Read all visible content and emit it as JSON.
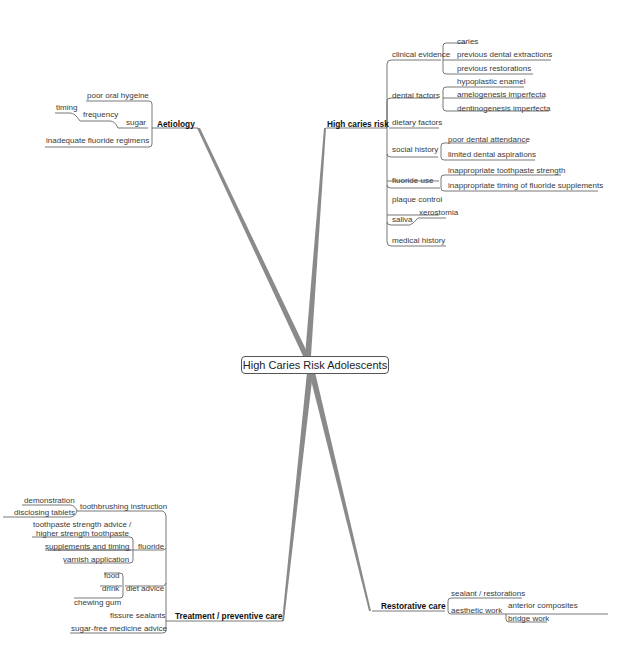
{
  "central": {
    "label": "High Caries Risk Adolescents"
  },
  "branches": {
    "aetiology": {
      "label": "Aetiology",
      "items": {
        "poor_oral_hygiene": "poor oral hygeine",
        "sugar": "sugar",
        "frequency": "frequency",
        "timing": "timing",
        "fluoride_regimens": "inadequate fluoride regimens"
      }
    },
    "high_caries_risk": {
      "label": "High caries risk",
      "clinical_evidence": {
        "label": "clinical evidence",
        "items": [
          "caries",
          "previous dental extractions",
          "previous restorations"
        ]
      },
      "dental_factors": {
        "label": "dental factors",
        "items": [
          "hypoplastic enamel",
          "amelogenesis imperfecta",
          "dentinogenesis imperfecta"
        ]
      },
      "dietary_factors": {
        "label": "dietary factors"
      },
      "social_history": {
        "label": "social history",
        "items": [
          "poor dental attendance",
          "limited dental aspirations"
        ]
      },
      "fluoride_use": {
        "label": "fluoride use",
        "items": [
          "inappropriate toothpaste strength",
          "inappropriate timing of fluoride supplements"
        ]
      },
      "plaque_control": {
        "label": "plaque control"
      },
      "saliva": {
        "label": "saliva",
        "items": [
          "xerostomia"
        ]
      },
      "medical_history": {
        "label": "medical history"
      }
    },
    "treatment": {
      "label": "Treatment / preventive care",
      "toothbrushing": {
        "label": "toothbrushing instruction",
        "items": [
          "demonstration",
          "disclosing tablets"
        ]
      },
      "fluoride": {
        "label": "fluoride",
        "items": [
          "toothpaste strength advice /",
          "higher strength toothpaste",
          "supplements and timing",
          "varnish application"
        ]
      },
      "diet_advice": {
        "label": "diet advice",
        "items": [
          "food",
          "drink",
          "chewing gum"
        ]
      },
      "fissure_sealants": {
        "label": "fissure sealants"
      },
      "sugar_free": {
        "label": "sugar-free medicine advice"
      }
    },
    "restorative": {
      "label": "Restorative care",
      "sealant": {
        "label": "sealant / restorations"
      },
      "aesthetic": {
        "label": "aesthetic work",
        "items": [
          "anterior composites",
          "bridge work"
        ]
      }
    }
  },
  "colors": {
    "branch": "#8a8a8a",
    "line": "#555555",
    "text": "#333333"
  }
}
